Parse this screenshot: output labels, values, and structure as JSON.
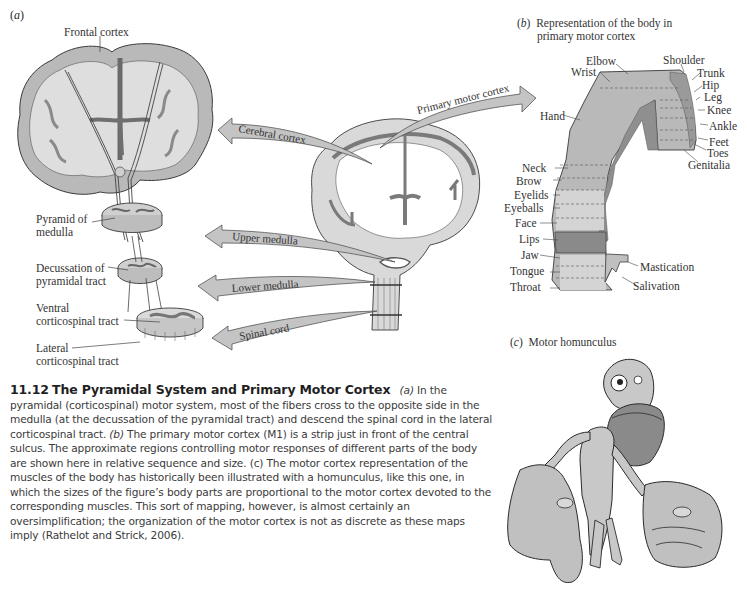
{
  "panel_a": {
    "label_prefix": "(",
    "label_letter": "a",
    "label_suffix": ")",
    "labels": {
      "frontal_cortex": "Frontal cortex",
      "pyramid_line1": "Pyramid of",
      "pyramid_line2": "medulla",
      "decussation_line1": "Decussation of",
      "decussation_line2": "pyramidal tract",
      "ventral_line1": "Ventral",
      "ventral_line2": "corticospinal tract",
      "lateral_line1": "Lateral",
      "lateral_line2": "corticospinal tract"
    },
    "arrows": {
      "cerebral_cortex": "Cerebral cortex",
      "primary_motor_cortex": "Primary motor cortex",
      "upper_medulla": "Upper medulla",
      "lower_medulla": "Lower medulla",
      "spinal_cord": "Spinal cord"
    }
  },
  "panel_b": {
    "label_letter": "b",
    "title_line1": "Representation of the body in",
    "title_line2": "primary motor cortex",
    "body_parts_top": [
      "Elbow",
      "Wrist",
      "Shoulder",
      "Trunk",
      "Hip",
      "Leg",
      "Knee",
      "Ankle",
      "Feet",
      "Toes",
      "Genitalia"
    ],
    "body_parts_left": [
      "Hand",
      "Neck",
      "Brow",
      "Eyelids",
      "Eyeballs",
      "Face",
      "Lips",
      "Jaw",
      "Tongue",
      "Throat"
    ],
    "body_parts_right": [
      "Mastication",
      "Salivation"
    ]
  },
  "panel_c": {
    "label_letter": "c",
    "title": "Motor homunculus"
  },
  "caption": {
    "figure_number": "11.12",
    "figure_title": "The Pyramidal System and Primary Motor Cortex",
    "text_a_ref": "(a)",
    "text_a": " In the pyramidal (corticospinal) motor system, most of the fibers cross to the opposite side in the medulla (at the decussation of the pyramidal tract) and descend the spinal cord in the lateral corticospinal tract. ",
    "text_b_ref": "(b)",
    "text_b": " The primary motor cortex (M1) is a strip just in front of the central sulcus. The approximate regions controlling motor responses of different parts of the body are shown here in relative sequence and size. (c) The motor cortex representation of the muscles of the body has historically been illustrated with a homunculus, like this one, in which the sizes of the figure’s body parts are proportional to the motor cortex devoted to the corresponding muscles. This sort of mapping, however, is almost certainly an oversimplification; the organization of the motor cortex is not as discrete as these maps imply (Rathelot and Strick, 2006)."
  },
  "colors": {
    "gray_matter": "#b9b9b9",
    "white_matter": "#dedede",
    "dark_tissue": "#7a7a7a",
    "arrow_fill": "#c4c4c4",
    "lips_highlight": "#8a8a8a",
    "outline": "#3a3a3a"
  }
}
